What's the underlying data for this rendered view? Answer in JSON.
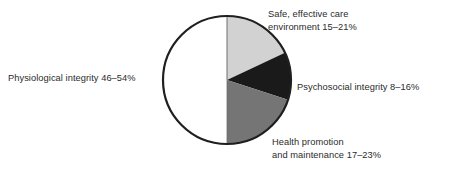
{
  "chart_data": {
    "type": "pie",
    "title": "",
    "subtitle": "",
    "xlabel": "",
    "ylabel": "",
    "grid": false,
    "legend_position": "outside-labels",
    "center": {
      "x": 227,
      "y": 80
    },
    "radius": 64,
    "start_angle_deg": -90,
    "direction": "clockwise",
    "categories": [
      "Safe, effective care environment",
      "Psychosocial integrity",
      "Health promotion and maintenance",
      "Physiological integrity"
    ],
    "values": [
      18,
      12,
      20,
      50
    ],
    "value_ranges": [
      {
        "low": 15,
        "high": 21
      },
      {
        "low": 8,
        "high": 16
      },
      {
        "low": 17,
        "high": 23
      },
      {
        "low": 46,
        "high": 54
      }
    ],
    "slice_colors": [
      "#d2d2d2",
      "#1a1a1a",
      "#757575",
      "#ffffff"
    ],
    "units": "%"
  },
  "colors": {
    "safe_effective_care": "#d2d2d2",
    "psychosocial_integrity": "#1a1a1a",
    "health_promotion": "#757575",
    "physiological_integrity": "#ffffff",
    "outline": "#1f1f1f",
    "label_text": "#2b2b2b",
    "background": "#ffffff"
  },
  "labels": {
    "physiological_integrity": "Physiological integrity 46–54%",
    "safe_effective_care": "Safe, effective care\nenvironment 15–21%",
    "psychosocial_integrity": "Psychosocial integrity 8–16%",
    "health_promotion": "Health promotion\nand maintenance 17–23%"
  }
}
